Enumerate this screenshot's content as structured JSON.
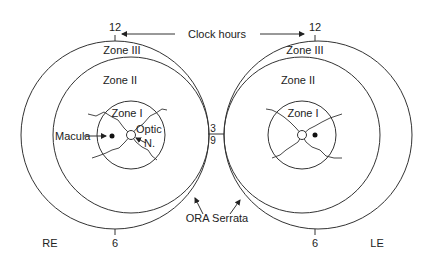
{
  "diagram": {
    "clock_hours_label": "Clock hours",
    "ora_serrata_label": "ORA Serrata",
    "eyes": [
      {
        "id": "right-eye",
        "label": "RE",
        "clock_top": "12",
        "clock_bottom": "6",
        "clock_side": "3",
        "zones": [
          "Zone III",
          "Zone II",
          "Zone I"
        ],
        "macula_label": "Macula",
        "optic_nerve_label": "Optic N."
      },
      {
        "id": "left-eye",
        "label": "LE",
        "clock_top": "12",
        "clock_bottom": "6",
        "clock_side": "9",
        "zones": [
          "Zone III",
          "Zone II",
          "Zone I"
        ]
      }
    ],
    "labels": {
      "re": "RE",
      "le": "LE",
      "re_12": "12",
      "le_12": "12",
      "re_6": "6",
      "le_6": "6",
      "three": "3",
      "nine": "9",
      "re_zone3": "Zone III",
      "re_zone2": "Zone II",
      "re_zone1": "Zone I",
      "le_zone3": "Zone III",
      "le_zone2": "Zone II",
      "le_zone1": "Zone I",
      "macula": "Macula",
      "optic": "Optic",
      "n": "N.",
      "clock_hours": "Clock hours",
      "ora": "ORA Serrata"
    }
  }
}
